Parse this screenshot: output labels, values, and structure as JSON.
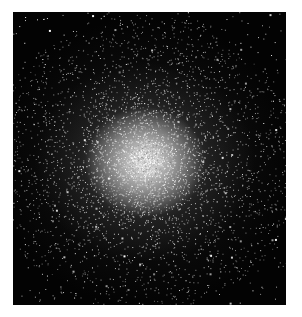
{
  "image": {
    "subject": "globular star cluster",
    "description": "Dense spherical cluster of stars with a bright whitish core fading into scattered stars on a black background",
    "colors": {
      "background": "#030303",
      "core": "#ebebeb",
      "page": "#ffffff"
    }
  }
}
